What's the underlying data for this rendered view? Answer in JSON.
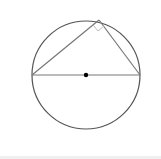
{
  "diagram": {
    "title": "",
    "circle": {
      "cx": 86,
      "cy": 75,
      "r": 54,
      "stroke": "#555555"
    },
    "center_point": {
      "x": 86,
      "y": 75,
      "r": 2.2,
      "fill": "#000000"
    },
    "diameter": {
      "x1": 32,
      "y1": 75,
      "x2": 140,
      "y2": 75,
      "stroke": "#777777"
    },
    "triangle": {
      "vertices": [
        {
          "x": 32,
          "y": 75
        },
        {
          "x": 99,
          "y": 20
        },
        {
          "x": 140,
          "y": 75
        }
      ],
      "stroke": "#777777"
    },
    "right_angle_marker": {
      "points": "93,25 98,31 104,26",
      "stroke": "#bbbbbb"
    },
    "labels": []
  }
}
